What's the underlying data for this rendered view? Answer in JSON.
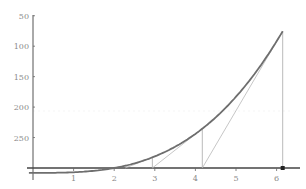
{
  "chart_data": {
    "type": "line",
    "title": "",
    "xlabel": "",
    "ylabel": "",
    "function": "x^3 - 8",
    "xlim": [
      0,
      6.4
    ],
    "ylim": [
      -20,
      255
    ],
    "x_ticks": [
      1,
      2,
      3,
      4,
      5,
      6
    ],
    "y_ticks": [
      50,
      100,
      150,
      200,
      250
    ],
    "grid": false,
    "legend": null,
    "series": [
      {
        "name": "f(x)",
        "x": [
          0,
          1,
          2,
          3,
          4,
          5,
          6,
          6.15
        ],
        "values": [
          -8,
          -7,
          0,
          19,
          56,
          117,
          208,
          224.6
        ]
      }
    ],
    "newton_iterations": [
      {
        "x": 6.15,
        "fx": 224.6,
        "next_x": 4.17
      },
      {
        "x": 4.17,
        "fx": 64.5,
        "next_x": 2.94
      },
      {
        "x": 2.94,
        "fx": 17.4,
        "next_x": 2.27
      }
    ],
    "marked_point": {
      "x": 6.15,
      "y": 0
    },
    "colors": {
      "curve": "#6e6e6e",
      "axis": "#555555",
      "tangent": "#b8b8b8",
      "vertical": "#a8a8a8",
      "point": "#222222"
    }
  },
  "axis_labels": {
    "x": [
      "1",
      "2",
      "3",
      "4",
      "5",
      "6"
    ],
    "y": [
      "250",
      "200",
      "150",
      "100",
      "50"
    ]
  }
}
